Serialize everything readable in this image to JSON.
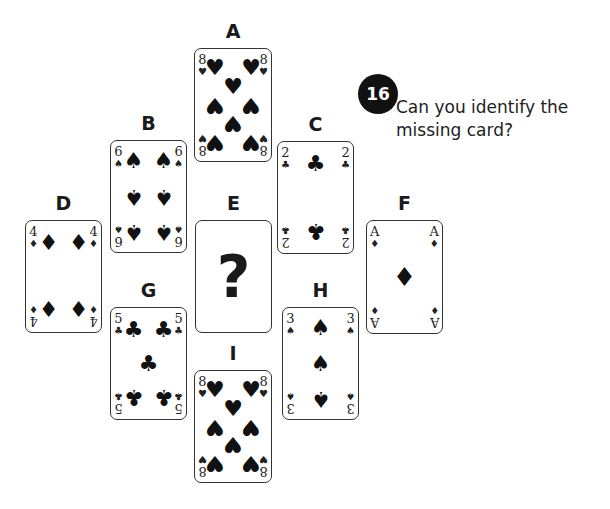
{
  "puzzle": {
    "number": "16",
    "question_line1": "Can you identify the",
    "question_line2": "missing card?"
  },
  "cards": {
    "A": {
      "label": "A",
      "rank": "8",
      "suit": "♥",
      "suit_name": "hearts",
      "pips_note": "upper pips hearts, lower pips spade-like (inverted hearts)"
    },
    "B": {
      "label": "B",
      "rank": "6",
      "suit": "♠",
      "suit_name": "spades"
    },
    "C": {
      "label": "C",
      "rank": "2",
      "suit": "♣",
      "suit_name": "clubs"
    },
    "D": {
      "label": "D",
      "rank": "4",
      "suit": "♦",
      "suit_name": "diamonds"
    },
    "E": {
      "label": "E",
      "content": "?",
      "missing": true
    },
    "F": {
      "label": "F",
      "rank": "A",
      "suit": "♦",
      "suit_name": "diamonds"
    },
    "G": {
      "label": "G",
      "rank": "5",
      "suit": "♣",
      "suit_name": "clubs"
    },
    "H": {
      "label": "H",
      "rank": "3",
      "suit": "♠",
      "suit_name": "spades"
    },
    "I": {
      "label": "I",
      "rank": "8",
      "suit": "♥",
      "suit_name": "hearts"
    }
  }
}
